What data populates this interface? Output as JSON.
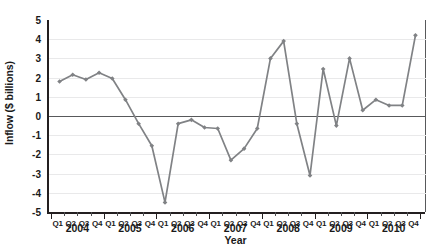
{
  "chart_data": {
    "type": "line",
    "title": "",
    "xlabel": "Year",
    "ylabel": "Inflow ($ billions)",
    "ylim": [
      -5,
      5
    ],
    "ytick_labels": [
      "5",
      "4",
      "3",
      "2",
      "1",
      "0",
      "-1",
      "-2",
      "-3",
      "-4",
      "-5"
    ],
    "ytick_values": [
      5,
      4,
      3,
      2,
      1,
      0,
      -1,
      -2,
      -3,
      -4,
      -5
    ],
    "grid": true,
    "legend": "none",
    "series_color": "#808285",
    "marker": "diamond",
    "categories": [
      "Q1",
      "Q2",
      "Q3",
      "Q4",
      "Q1",
      "Q2",
      "Q3",
      "Q4",
      "Q1",
      "Q2",
      "Q3",
      "Q4",
      "Q1",
      "Q2",
      "Q3",
      "Q4",
      "Q1",
      "Q2",
      "Q3",
      "Q4",
      "Q1",
      "Q2",
      "Q3",
      "Q4",
      "Q1",
      "Q2",
      "Q3",
      "Q4"
    ],
    "years": [
      "2004",
      "2005",
      "2006",
      "2007",
      "2008",
      "2009",
      "2010"
    ],
    "year_groups": [
      {
        "year": "2004",
        "quarters": [
          "Q1",
          "Q2",
          "Q3",
          "Q4"
        ]
      },
      {
        "year": "2005",
        "quarters": [
          "Q1",
          "Q2",
          "Q3",
          "Q4"
        ]
      },
      {
        "year": "2006",
        "quarters": [
          "Q1",
          "Q2",
          "Q3",
          "Q4"
        ]
      },
      {
        "year": "2007",
        "quarters": [
          "Q1",
          "Q2",
          "Q3",
          "Q4"
        ]
      },
      {
        "year": "2008",
        "quarters": [
          "Q1",
          "Q2",
          "Q3",
          "Q4"
        ]
      },
      {
        "year": "2009",
        "quarters": [
          "Q1",
          "Q2",
          "Q3",
          "Q4"
        ]
      },
      {
        "year": "2010",
        "quarters": [
          "Q1",
          "Q2",
          "Q3",
          "Q4"
        ]
      }
    ],
    "x": [
      "2004 Q1",
      "2004 Q2",
      "2004 Q3",
      "2004 Q4",
      "2005 Q1",
      "2005 Q2",
      "2005 Q3",
      "2005 Q4",
      "2006 Q1",
      "2006 Q2",
      "2006 Q3",
      "2006 Q4",
      "2007 Q1",
      "2007 Q2",
      "2007 Q3",
      "2007 Q4",
      "2008 Q1",
      "2008 Q2",
      "2008 Q3",
      "2008 Q4",
      "2009 Q1",
      "2009 Q2",
      "2009 Q3",
      "2009 Q4",
      "2010 Q1",
      "2010 Q2",
      "2010 Q3",
      "2010 Q4"
    ],
    "values": [
      1.8,
      2.15,
      1.9,
      2.25,
      1.95,
      0.85,
      -0.4,
      -1.55,
      -4.5,
      -0.4,
      -0.2,
      -0.6,
      -0.65,
      -2.3,
      -1.7,
      -0.65,
      3.0,
      3.9,
      -0.4,
      -3.1,
      2.45,
      -0.5,
      3.0,
      0.3,
      0.85,
      0.55,
      0.55,
      4.2
    ]
  }
}
